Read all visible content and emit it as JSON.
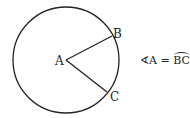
{
  "diagram": {
    "type": "circle-central-angle",
    "circle": {
      "cx": 66,
      "cy": 60,
      "r": 53,
      "stroke": "#222222"
    },
    "points": {
      "A": {
        "label": "A",
        "x": 66,
        "y": 60
      },
      "B": {
        "label": "B",
        "x": 112,
        "y": 36
      },
      "C": {
        "label": "C",
        "x": 107,
        "y": 92
      }
    },
    "segments": [
      [
        "A",
        "B"
      ],
      [
        "A",
        "C"
      ]
    ],
    "equation": {
      "angle_symbol": "∢",
      "angle_vertex": "A",
      "equals": "=",
      "arc": "BC"
    }
  }
}
